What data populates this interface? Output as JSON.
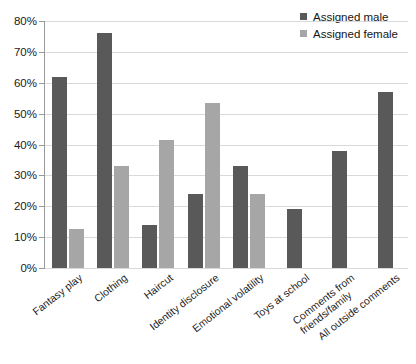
{
  "chart_data": {
    "type": "bar",
    "title": "",
    "subtitle": "",
    "xlabel": "",
    "ylabel": "",
    "ylim": [
      0,
      80
    ],
    "ytick_step": 10,
    "grid": true,
    "legend_position": "top-right",
    "yticks": [
      "0%",
      "10%",
      "20%",
      "30%",
      "40%",
      "50%",
      "60%",
      "70%",
      "80%"
    ],
    "ytick_values": [
      0,
      10,
      20,
      30,
      40,
      50,
      60,
      70,
      80
    ],
    "categories": [
      "Fantasy play",
      "Clothing",
      "Haircut",
      "Identity disclosure",
      "Emotional volatility",
      "Toys at school",
      "Comments from friends/family",
      "All outside comments"
    ],
    "category_lines": [
      [
        "Fantasy play"
      ],
      [
        "Clothing"
      ],
      [
        "Haircut"
      ],
      [
        "Identity disclosure"
      ],
      [
        "Emotional volatility"
      ],
      [
        "Toys at school"
      ],
      [
        "Comments from",
        "friends/family"
      ],
      [
        "All outside comments"
      ]
    ],
    "series": [
      {
        "name": "Assigned male",
        "color": "#595959",
        "values": [
          62,
          76,
          14,
          24,
          33,
          19,
          38,
          57
        ]
      },
      {
        "name": "Assigned female",
        "color": "#a6a6a6",
        "values": [
          12.5,
          33,
          41.5,
          53.5,
          24,
          null,
          null,
          null
        ]
      }
    ]
  },
  "legend": {
    "items": [
      {
        "label": "Assigned male",
        "color": "#595959"
      },
      {
        "label": "Assigned female",
        "color": "#a6a6a6"
      }
    ]
  },
  "colors": {
    "assigned_male": "#595959",
    "assigned_female": "#a6a6a6",
    "gridline": "#d9d9d9",
    "axis": "#9a9a9a",
    "background": "#ffffff"
  }
}
